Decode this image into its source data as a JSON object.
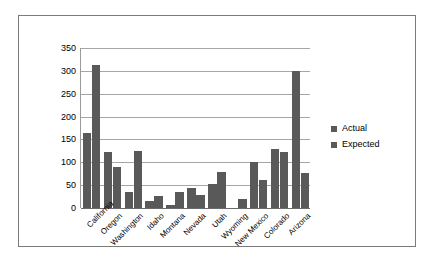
{
  "chart_data": {
    "type": "bar",
    "title": "",
    "xlabel": "",
    "ylabel": "",
    "ylim": [
      0,
      350
    ],
    "ytick_step": 50,
    "yticks": [
      0,
      50,
      100,
      150,
      200,
      250,
      300,
      350
    ],
    "grid": true,
    "legend_position": "right",
    "categories": [
      "California",
      "Oregon",
      "Washington",
      "Idaho",
      "Montana",
      "Nevada",
      "Utah",
      "Wyoming",
      "New Mexico",
      "Colorado",
      "Arizona"
    ],
    "series": [
      {
        "name": "Actual",
        "color": "#595959",
        "values": [
          165,
          122,
          36,
          16,
          6,
          43,
          53,
          0,
          100,
          129,
          299
        ]
      },
      {
        "name": "Expected",
        "color": "#595959",
        "values": [
          313,
          90,
          125,
          26,
          34,
          28,
          78,
          20,
          62,
          123,
          77
        ]
      }
    ]
  },
  "legend": {
    "items": [
      {
        "label": "Actual"
      },
      {
        "label": "Expected"
      }
    ]
  },
  "colors": {
    "bar": "#595959",
    "gridline": "#a6a6a6",
    "axis": "#6b6b6b",
    "frame": "#7b7b7b",
    "background": "#ffffff"
  }
}
